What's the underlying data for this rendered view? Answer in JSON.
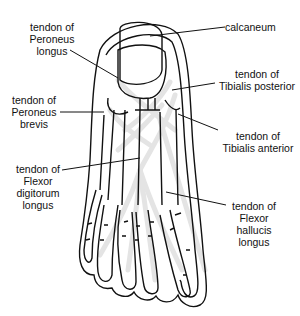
{
  "diagram": {
    "colors": {
      "outline": "#111111",
      "tendon": "#e4e4e4",
      "background": "#ffffff"
    },
    "labels": [
      {
        "id": "peroneus-longus",
        "lines": [
          "tendon of",
          "Peroneus",
          "longus"
        ]
      },
      {
        "id": "peroneus-brevis",
        "lines": [
          "tendon of",
          "Peroneus",
          "brevis"
        ]
      },
      {
        "id": "flexor-digitorum-longus",
        "lines": [
          "tendon of",
          "Flexor",
          "digitorum",
          "longus"
        ]
      },
      {
        "id": "calcaneum",
        "lines": [
          "calcaneum"
        ]
      },
      {
        "id": "tibialis-posterior",
        "lines": [
          "tendon of",
          "Tibialis posterior"
        ]
      },
      {
        "id": "tibialis-anterior",
        "lines": [
          "tendon of",
          "Tibialis anterior"
        ]
      },
      {
        "id": "flexor-hallucis-longus",
        "lines": [
          "tendon of",
          "Flexor",
          "hallucis",
          "longus"
        ]
      }
    ]
  }
}
